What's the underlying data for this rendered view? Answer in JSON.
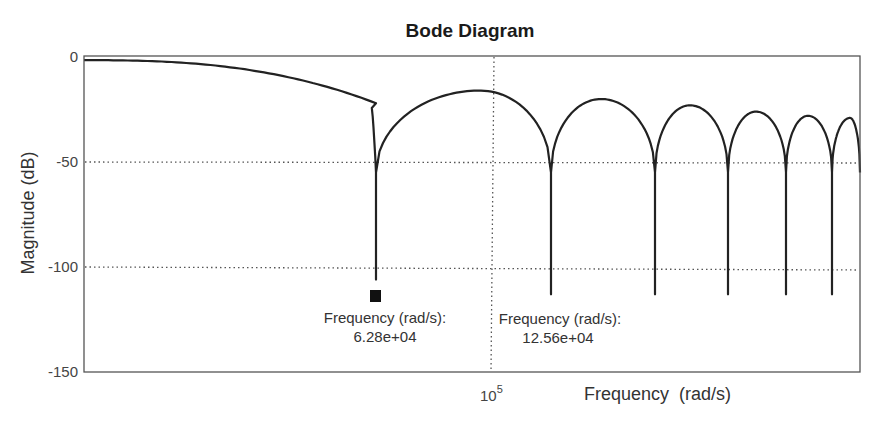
{
  "chart_data": {
    "type": "line",
    "title": "Bode Diagram",
    "xlabel": "Frequency  (rad/s)",
    "ylabel": "Magnitude (dB)",
    "xscale": "log",
    "ylim": [
      -150,
      0
    ],
    "yticks": [
      0,
      -50,
      -100,
      -150
    ],
    "ytick_labels": [
      "0",
      "-50",
      "-100",
      "-150"
    ],
    "xticks": [
      100000
    ],
    "xtick_labels": [
      {
        "base": "10",
        "exp": "5"
      }
    ],
    "grid": true,
    "grid_style": "dotted",
    "legend": null,
    "series": [
      {
        "name": "Magnitude",
        "color": "#222222",
        "notch_frequencies_rad_s": [
          62800,
          125600
        ],
        "notch_depth_db": -113,
        "points_px_note": "piecewise description in plot pixel space",
        "segments": [
          {
            "kind": "rolloff",
            "x_start": 84,
            "x_end": 376,
            "y_start_db": -1.5,
            "y_end_db": -22
          },
          {
            "kind": "notch",
            "x": 376,
            "depth_db": -106
          },
          {
            "kind": "lobe",
            "x_start": 376,
            "x_end": 551,
            "peak_x": 480,
            "peak_db": -16
          },
          {
            "kind": "notch",
            "x": 551,
            "depth_db": -113
          },
          {
            "kind": "lobe",
            "x_start": 551,
            "x_end": 655,
            "peak_x": 601,
            "peak_db": -20
          },
          {
            "kind": "notch",
            "x": 655,
            "depth_db": -113
          },
          {
            "kind": "lobe",
            "x_start": 655,
            "x_end": 728,
            "peak_x": 690,
            "peak_db": -23
          },
          {
            "kind": "notch",
            "x": 728,
            "depth_db": -113
          },
          {
            "kind": "lobe",
            "x_start": 728,
            "x_end": 786,
            "peak_x": 756,
            "peak_db": -26
          },
          {
            "kind": "notch",
            "x": 786,
            "depth_db": -113
          },
          {
            "kind": "lobe",
            "x_start": 786,
            "x_end": 832,
            "peak_x": 808,
            "peak_db": -28
          },
          {
            "kind": "notch",
            "x": 832,
            "depth_db": -113
          },
          {
            "kind": "lobe",
            "x_start": 832,
            "x_end": 860,
            "peak_x": 850,
            "peak_db": -29
          }
        ]
      }
    ],
    "annotations": [
      {
        "label": "Frequency (rad/s):",
        "value": "6.28e+04",
        "marker": "square"
      },
      {
        "label": "Frequency (rad/s):",
        "value": "12.56e+04",
        "marker": "none"
      }
    ]
  },
  "title": "Bode Diagram",
  "xlabel": "Frequency  (rad/s)",
  "ylabel": "Magnitude (dB)",
  "yticks": [
    "0",
    "-50",
    "-100",
    "-150"
  ],
  "xtick": {
    "base": "10",
    "exp": "5"
  },
  "annotations": [
    {
      "label": "Frequency (rad/s):",
      "value": "6.28e+04"
    },
    {
      "label": "Frequency (rad/s):",
      "value": "12.56e+04"
    }
  ],
  "colors": {
    "line": "#222222",
    "frame": "#555555",
    "grid": "#555555",
    "marker": "#111111"
  }
}
